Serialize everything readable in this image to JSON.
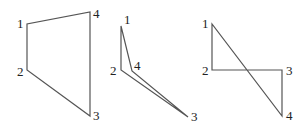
{
  "figures": [
    {
      "id": "quadrilateral-convex",
      "vertices": [
        {
          "label": "1",
          "x": 27,
          "y": 24,
          "lx": 17,
          "ly": 28
        },
        {
          "label": "2",
          "x": 27,
          "y": 70,
          "lx": 17,
          "ly": 76
        },
        {
          "label": "3",
          "x": 90,
          "y": 116,
          "lx": 93,
          "ly": 120
        },
        {
          "label": "4",
          "x": 90,
          "y": 12,
          "lx": 93,
          "ly": 18
        }
      ],
      "path": "27,24 27,70 90,116 90,12"
    },
    {
      "id": "quadrilateral-concave",
      "vertices": [
        {
          "label": "1",
          "x": 121,
          "y": 26,
          "lx": 124,
          "ly": 24
        },
        {
          "label": "2",
          "x": 121,
          "y": 70,
          "lx": 110,
          "ly": 75
        },
        {
          "label": "3",
          "x": 188,
          "y": 117,
          "lx": 191,
          "ly": 121
        },
        {
          "label": "4",
          "x": 132,
          "y": 71,
          "lx": 134,
          "ly": 70
        }
      ],
      "path": "121,26 121,70 188,117 132,71"
    },
    {
      "id": "quadrilateral-self-intersecting",
      "vertices": [
        {
          "label": "1",
          "x": 212,
          "y": 24,
          "lx": 202,
          "ly": 28
        },
        {
          "label": "2",
          "x": 212,
          "y": 70,
          "lx": 202,
          "ly": 75
        },
        {
          "label": "3",
          "x": 282,
          "y": 70,
          "lx": 286,
          "ly": 75
        },
        {
          "label": "4",
          "x": 282,
          "y": 116,
          "lx": 286,
          "ly": 120
        }
      ],
      "path": "212,24 212,70 282,70 282,116"
    }
  ]
}
